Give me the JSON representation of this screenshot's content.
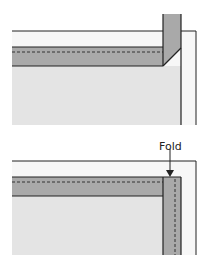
{
  "diagrams": [
    {
      "id": "top",
      "description": "Binding strip with corner folded up at 45 degrees",
      "colors": {
        "fabric": "#e6e6e6",
        "backing": "#f7f7f7",
        "binding": "#a9a9a9",
        "outline": "#222222"
      }
    },
    {
      "id": "bottom",
      "description": "Binding folded down along the right edge",
      "annotation": {
        "label": "Fold"
      },
      "colors": {
        "fabric": "#e6e6e6",
        "backing": "#f7f7f7",
        "binding": "#a9a9a9",
        "outline": "#222222"
      }
    }
  ]
}
